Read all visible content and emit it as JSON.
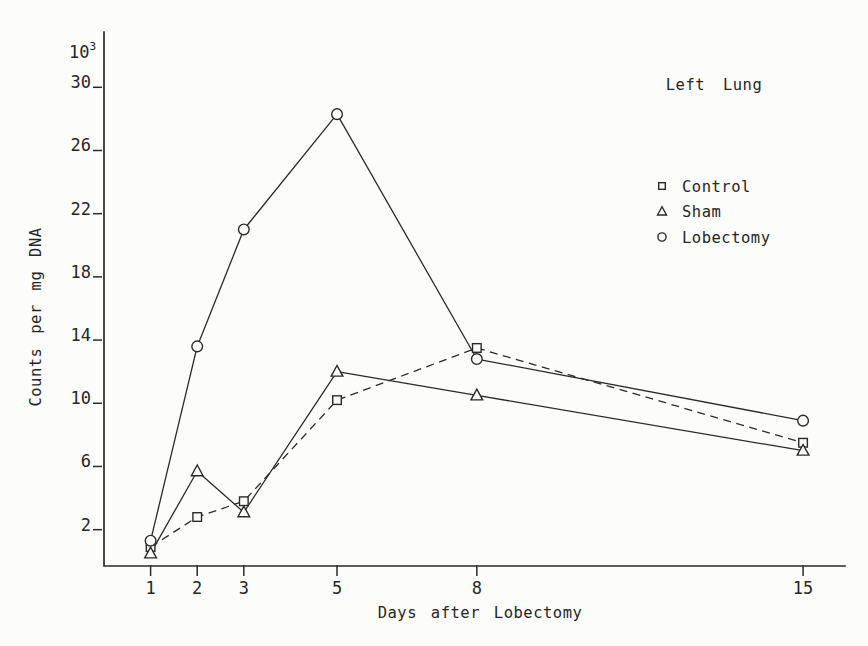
{
  "figure": {
    "background": "#fcfcfb",
    "ink": "#2a2a2a"
  },
  "chart_data": {
    "type": "line",
    "title": "Left Lung",
    "xlabel": "Days after Lobectomy",
    "ylabel": "Counts per mg DNA",
    "y_scale_label": {
      "base": "10",
      "exponent": "3"
    },
    "units": "x10^3 counts per mg DNA",
    "x": [
      1,
      2,
      3,
      5,
      8,
      15
    ],
    "x_ticks": [
      "1",
      "2",
      "3",
      "5",
      "8",
      "15"
    ],
    "y_ticks": [
      "2",
      "6",
      "10",
      "14",
      "18",
      "22",
      "26",
      "30"
    ],
    "y_tick_values": [
      2,
      6,
      10,
      14,
      18,
      22,
      26,
      30
    ],
    "xlim": [
      0,
      15.9
    ],
    "ylim": [
      -0.3,
      33.5
    ],
    "grid": false,
    "legend_position": "upper-right",
    "series": [
      {
        "name": "Control",
        "marker": "square",
        "line_style": "dashed",
        "values": [
          0.9,
          2.8,
          3.8,
          10.2,
          13.5,
          7.5
        ]
      },
      {
        "name": "Sham",
        "marker": "triangle",
        "line_style": "solid",
        "values": [
          0.5,
          5.7,
          3.1,
          12.0,
          10.5,
          7.0
        ]
      },
      {
        "name": "Lobectomy",
        "marker": "circle",
        "line_style": "solid",
        "values": [
          1.3,
          13.6,
          21.0,
          28.3,
          12.8,
          8.9
        ]
      }
    ]
  }
}
